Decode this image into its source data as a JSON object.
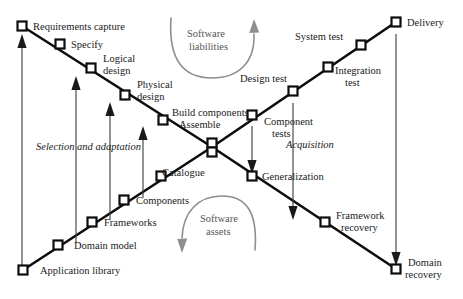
{
  "diagram": {
    "colors": {
      "spine": "#0d0d0d",
      "node_fill": "#ffffff",
      "node_stroke": "#0d0d0d",
      "vertical_arrow": "#3b3b3b",
      "arc": "#8e8e8e",
      "text": "#1a1a1a",
      "arc_text": "#555555",
      "background": "#ffffff"
    },
    "development_branch": {
      "name": "development-descending-branch",
      "nodes": [
        {
          "id": "requirements-capture",
          "label": "Requirements capture",
          "x": 22,
          "y": 26,
          "label_x": 33,
          "label_y": 30,
          "anchor": "start"
        },
        {
          "id": "specify",
          "label": "Specify",
          "x": 60,
          "y": 44,
          "label_x": 71,
          "label_y": 48,
          "anchor": "start"
        },
        {
          "id": "logical-design",
          "label": "Logical\ndesign",
          "x": 91,
          "y": 68,
          "label_x": 103,
          "label_y": 62,
          "anchor": "start"
        },
        {
          "id": "physical-design",
          "label": "Physical\ndesign",
          "x": 125,
          "y": 95,
          "label_x": 137,
          "label_y": 88,
          "anchor": "start"
        },
        {
          "id": "build-components-assemble",
          "label": "Build components\nAssemble",
          "x": 163,
          "y": 120,
          "label_x": 175,
          "label_y": 116,
          "anchor": "start"
        },
        {
          "id": "catalogue-crossing",
          "label": "Catalogue",
          "x": 212,
          "y": 147,
          "label_x": 162,
          "label_y": 176,
          "anchor": "start"
        }
      ]
    },
    "testing_branch": {
      "name": "testing-ascending-branch",
      "nodes": [
        {
          "id": "component-tests",
          "label": "Component\ntests",
          "x": 252,
          "y": 115,
          "label_x": 264,
          "label_y": 128,
          "anchor": "start"
        },
        {
          "id": "design-test",
          "label": "Design test",
          "x": 293,
          "y": 91,
          "label_x": 243,
          "label_y": 82,
          "anchor": "start"
        },
        {
          "id": "system-test",
          "label": "System test",
          "x": 328,
          "y": 67,
          "label_x": 295,
          "label_y": 40,
          "anchor": "start"
        },
        {
          "id": "integration-test",
          "label": "Integration\ntest",
          "x": 361,
          "y": 45,
          "label_x": 335,
          "label_y": 74,
          "anchor": "start"
        },
        {
          "id": "delivery",
          "label": "Delivery",
          "x": 396,
          "y": 22,
          "label_x": 407,
          "label_y": 26,
          "anchor": "start"
        }
      ]
    },
    "reuse_asset_branch": {
      "name": "reuse-assets-ascending-branch",
      "nodes": [
        {
          "id": "application-library",
          "label": "Application library",
          "x": 23,
          "y": 270,
          "label_x": 40,
          "label_y": 274,
          "anchor": "start"
        },
        {
          "id": "domain-model",
          "label": "Domain model",
          "x": 58,
          "y": 245,
          "label_x": 74,
          "label_y": 249,
          "anchor": "start"
        },
        {
          "id": "frameworks",
          "label": "Frameworks",
          "x": 92,
          "y": 222,
          "label_x": 104,
          "label_y": 226,
          "anchor": "start"
        },
        {
          "id": "components",
          "label": "Components",
          "x": 124,
          "y": 200,
          "label_x": 136,
          "label_y": 204,
          "anchor": "start"
        },
        {
          "id": "catalogue-node",
          "label": "Catalogue",
          "x": 161,
          "y": 176,
          "label_x": 0,
          "label_y": 0,
          "anchor": "start"
        }
      ]
    },
    "recovery_branch": {
      "name": "recovery-descending-branch",
      "nodes": [
        {
          "id": "generalization",
          "label": "Generalization",
          "x": 252,
          "y": 176,
          "label_x": 263,
          "label_y": 180,
          "anchor": "start"
        },
        {
          "id": "framework-recovery",
          "label": "Framework\nrecovery",
          "x": 325,
          "y": 222,
          "label_x": 337,
          "label_y": 219,
          "anchor": "start"
        },
        {
          "id": "domain-recovery",
          "label": "Domain\nrecovery",
          "x": 396,
          "y": 269,
          "label_x": 408,
          "label_y": 266,
          "anchor": "start"
        }
      ]
    },
    "phase_labels": [
      {
        "id": "selection-and-adaptation",
        "text": "Selection and adaptation",
        "x": 36,
        "y": 150
      },
      {
        "id": "acquisition",
        "text": "Acquisition",
        "x": 286,
        "y": 148
      }
    ],
    "arc_annotations": [
      {
        "id": "software-liabilities",
        "line1": "Software",
        "line2": "liabilities",
        "x": 212,
        "y": 39,
        "direction": "upward-right"
      },
      {
        "id": "software-assets",
        "line1": "Software",
        "line2": "assets",
        "x": 222,
        "y": 224,
        "direction": "downward-left"
      }
    ],
    "vertical_arrows": [
      {
        "id": "arrow-application-library-to-requirements",
        "x": 22,
        "y_from": 268,
        "y_to": 40,
        "direction": "up"
      },
      {
        "id": "arrow-domain-model-to-specify",
        "x": 76,
        "y_from": 243,
        "y_to": 82,
        "direction": "up"
      },
      {
        "id": "arrow-frameworks-to-logical-design",
        "x": 110,
        "y_from": 220,
        "y_to": 108,
        "direction": "up"
      },
      {
        "id": "arrow-components-to-physical-design",
        "x": 143,
        "y_from": 198,
        "y_to": 132,
        "direction": "up"
      },
      {
        "id": "arrow-component-tests-to-generalization",
        "x": 252,
        "y_from": 128,
        "y_to": 170,
        "direction": "down"
      },
      {
        "id": "arrow-design-test-to-framework-recovery",
        "x": 293,
        "y_from": 105,
        "y_to": 216,
        "direction": "down"
      },
      {
        "id": "arrow-delivery-to-domain-recovery",
        "x": 396,
        "y_from": 36,
        "y_to": 262,
        "direction": "down"
      }
    ]
  }
}
